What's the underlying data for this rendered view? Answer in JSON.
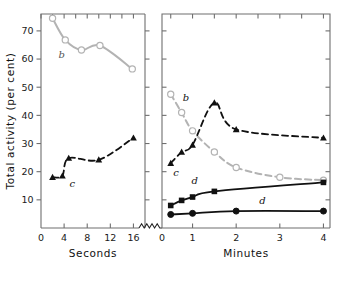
{
  "chart_data": {
    "type": "line",
    "title": "",
    "ylabel": "Total activity (per cent)",
    "ylim": [
      0,
      76
    ],
    "yticks": [
      10,
      20,
      30,
      40,
      50,
      60,
      70
    ],
    "panels": [
      {
        "name": "seconds-panel",
        "xlabel": "Seconds",
        "xlim": [
          0,
          18
        ],
        "xticks": [
          0,
          4,
          8,
          12,
          16
        ],
        "axis_break_right": true,
        "series": [
          {
            "name": "b",
            "label": "b",
            "marker": "open-circle",
            "color": "#b3b3b3",
            "linestyle": "solid",
            "x": [
              2.0,
              4.2,
              7.0,
              10.2,
              15.8
            ],
            "y": [
              74.5,
              66.8,
              63.2,
              64.8,
              56.5
            ]
          },
          {
            "name": "c",
            "label": "c",
            "marker": "filled-triangle",
            "color": "#111111",
            "linestyle": "dashed",
            "x": [
              2.0,
              3.7,
              4.8,
              10.0,
              16.0
            ],
            "y": [
              18.0,
              18.5,
              24.8,
              24.2,
              32.0
            ]
          }
        ]
      },
      {
        "name": "minutes-panel",
        "xlabel": "Minutes",
        "xlim": [
          0.3,
          4.15
        ],
        "xticks": [
          0,
          1,
          2,
          3,
          4
        ],
        "series": [
          {
            "name": "b",
            "label": "b",
            "marker": "open-circle",
            "color": "#b3b3b3",
            "linestyle": "dashed",
            "x": [
              0.5,
              0.75,
              1.0,
              1.5,
              2.0,
              3.0,
              4.0
            ],
            "y": [
              47.5,
              41.0,
              34.5,
              27.0,
              21.5,
              18.0,
              17.0
            ]
          },
          {
            "name": "c",
            "label": "c",
            "marker": "filled-triangle",
            "color": "#111111",
            "linestyle": "dashed",
            "x": [
              0.5,
              0.75,
              1.0,
              1.5,
              2.0,
              4.0
            ],
            "y": [
              23.0,
              27.0,
              29.5,
              44.5,
              35.0,
              32.0
            ]
          },
          {
            "name": "d-squares",
            "label": "d",
            "marker": "filled-square",
            "color": "#111111",
            "linestyle": "solid",
            "x": [
              0.5,
              0.75,
              1.0,
              1.5,
              4.0
            ],
            "y": [
              8.0,
              9.8,
              11.0,
              13.0,
              16.2
            ]
          },
          {
            "name": "d-circles",
            "label": "d",
            "marker": "filled-circle",
            "color": "#111111",
            "linestyle": "solid",
            "x": [
              0.5,
              1.0,
              2.0,
              4.0
            ],
            "y": [
              4.8,
              5.2,
              6.0,
              6.0
            ]
          }
        ]
      }
    ],
    "annotations": [
      {
        "text": "b",
        "panel": "seconds-panel",
        "x": 3.6,
        "y": 60.5,
        "style": "gray"
      },
      {
        "text": "c",
        "panel": "seconds-panel",
        "x": 5.4,
        "y": 14.5,
        "style": "dark"
      },
      {
        "text": "b",
        "panel": "minutes-panel",
        "x": 0.85,
        "y": 45.0,
        "style": "dark"
      },
      {
        "text": "c",
        "panel": "minutes-panel",
        "x": 0.62,
        "y": 18.5,
        "style": "dark"
      },
      {
        "text": "d",
        "panel": "minutes-panel",
        "x": 1.05,
        "y": 15.5,
        "style": "dark"
      },
      {
        "text": "d",
        "panel": "minutes-panel",
        "x": 2.6,
        "y": 8.5,
        "style": "dark"
      }
    ],
    "colors": {
      "series_b": "#b3b3b3",
      "series_c": "#111111",
      "series_d": "#111111",
      "axis": "#6f6f6f",
      "text": "#1a1a1a"
    }
  }
}
